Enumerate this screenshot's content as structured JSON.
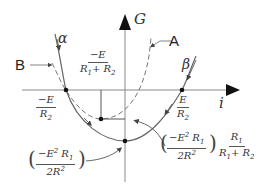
{
  "diagram": {
    "axes": {
      "x_label": "i",
      "y_label": "G"
    },
    "curve_labels": {
      "alpha": "α",
      "beta": "β",
      "A": "A",
      "B": "B"
    },
    "annotations": {
      "left_intercept": {
        "num": "−E",
        "den": "R",
        "den_sub": "2"
      },
      "right_intercept": {
        "num": "E",
        "den": "R",
        "den_sub": "2"
      },
      "vertex_x": {
        "num": "−E",
        "den_a": "R",
        "den_a_sub": "1",
        "den_plus": "+ R",
        "den_b_sub": "2"
      },
      "min_left": {
        "num_a": "−E",
        "num_a_sup": "2",
        "num_b": " R",
        "num_b_sub": "1",
        "den": "2R",
        "den_sub": "2",
        "den_sup": "2"
      },
      "min_right_first": {
        "num_a": "−E",
        "num_a_sup": "2",
        "num_b": " R",
        "num_b_sub": "1",
        "den": "2R",
        "den_sub": "2",
        "den_sup": "2"
      },
      "min_right_second": {
        "num": "R",
        "num_sub": "1",
        "den_a": "R",
        "den_a_sub": "1",
        "den_plus": "+ R",
        "den_b_sub": "2"
      }
    },
    "colors": {
      "axis": "#777777",
      "curve": "#555555",
      "point": "#111111"
    }
  }
}
